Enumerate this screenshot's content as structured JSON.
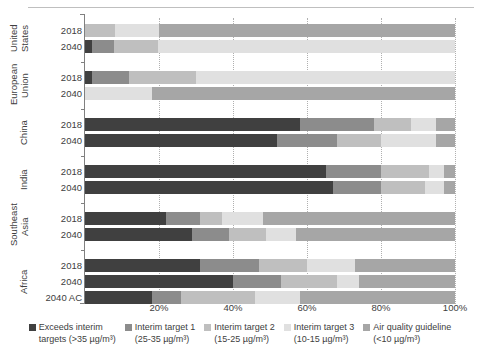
{
  "chart_data": {
    "type": "bar",
    "orientation": "horizontal",
    "stacked": true,
    "normalized": true,
    "title": "",
    "xlabel": "",
    "ylabel": "",
    "xlim": [
      0,
      100
    ],
    "xticks": [
      "20%",
      "40%",
      "60%",
      "80%",
      "100%"
    ],
    "xtick_values": [
      20,
      40,
      60,
      80,
      100
    ],
    "grid": "vertical-dotted",
    "legend_position": "bottom",
    "series": [
      {
        "name": "Exceeds interim targets (>35 µg/m³)",
        "color": "#404040"
      },
      {
        "name": "Interim target 1 (25-35 µg/m³)",
        "color": "#8c8c8c"
      },
      {
        "name": "Interim target 2 (15-25 µg/m³)",
        "color": "#bfbfbf"
      },
      {
        "name": "Interim target 3 (10-15 µg/m³)",
        "color": "#e0e0e0"
      },
      {
        "name": "Air quality guideline (<10 µg/m³)",
        "color": "#a6a6a6"
      }
    ],
    "groups": [
      {
        "region": "United States",
        "rows": [
          {
            "year": "2018",
            "values": [
              0,
              0,
              8,
              12,
              80
            ]
          },
          {
            "year": "2040",
            "values": [
              2,
              6,
              12,
              82,
              0
            ]
          }
        ]
      },
      {
        "region": "European Union",
        "rows": [
          {
            "year": "2018",
            "values": [
              2,
              10,
              18,
              70,
              0
            ]
          },
          {
            "year": "2040",
            "values": [
              0,
              0,
              0,
              18,
              82
            ]
          }
        ]
      },
      {
        "region": "China",
        "rows": [
          {
            "year": "2018",
            "values": [
              58,
              20,
              10,
              7,
              5
            ]
          },
          {
            "year": "2040",
            "values": [
              52,
              16,
              12,
              15,
              5
            ]
          }
        ]
      },
      {
        "region": "India",
        "rows": [
          {
            "year": "2018",
            "values": [
              65,
              15,
              13,
              4,
              3
            ]
          },
          {
            "year": "2040",
            "values": [
              67,
              13,
              12,
              5,
              3
            ]
          }
        ]
      },
      {
        "region": "Southeast Asia",
        "rows": [
          {
            "year": "2018",
            "values": [
              22,
              9,
              6,
              11,
              52
            ]
          },
          {
            "year": "2040",
            "values": [
              29,
              10,
              10,
              8,
              43
            ]
          }
        ]
      },
      {
        "region": "Africa",
        "rows": [
          {
            "year": "2018",
            "values": [
              31,
              16,
              13,
              13,
              27
            ]
          },
          {
            "year": "2040",
            "values": [
              40,
              13,
              15,
              6,
              26
            ]
          },
          {
            "year": "2040 AC",
            "values": [
              18,
              8,
              20,
              12,
              42
            ]
          }
        ]
      }
    ]
  },
  "legend": {
    "items": [
      {
        "label": "Exceeds interim\ntargets (>35 µg/m³)",
        "color": "#404040",
        "icon": "legend-swatch"
      },
      {
        "label": "Interim target 1\n(25-35 µg/m³)",
        "color": "#8c8c8c",
        "icon": "legend-swatch"
      },
      {
        "label": "Interim target 2\n(15-25 µg/m³)",
        "color": "#bfbfbf",
        "icon": "legend-swatch"
      },
      {
        "label": "Interim target 3\n(10-15 µg/m³)",
        "color": "#e0e0e0",
        "icon": "legend-swatch"
      },
      {
        "label": "Air quality guideline\n(<10 µg/m³)",
        "color": "#a6a6a6",
        "icon": "legend-swatch"
      }
    ]
  }
}
